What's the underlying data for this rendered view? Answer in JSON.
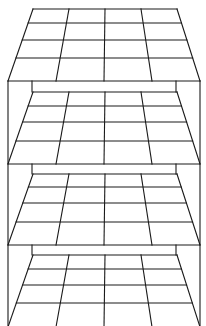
{
  "diagram": {
    "title": "",
    "colors": {
      "stroke": "#1a1a1a",
      "background": "#ffffff"
    },
    "frame": {
      "left_x": 8,
      "right_x": 200,
      "inner_left_x": 32,
      "inner_right_x": 176
    },
    "grid": {
      "columns": 4,
      "rows": 4
    },
    "planes": [
      {
        "name": "plane-1",
        "top_y": 9,
        "bottom_y": 81,
        "top_x": [
          33,
          177
        ],
        "bottom_x": [
          8,
          200
        ],
        "rows_y": [
          9,
          23,
          40,
          58,
          81
        ]
      },
      {
        "name": "plane-2",
        "top_y": 92,
        "bottom_y": 164,
        "top_x": [
          33,
          177
        ],
        "bottom_x": [
          8,
          200
        ],
        "rows_y": [
          92,
          106,
          122,
          141,
          164
        ]
      },
      {
        "name": "plane-3",
        "top_y": 174,
        "bottom_y": 245,
        "top_x": [
          33,
          177
        ],
        "bottom_x": [
          8,
          200
        ],
        "rows_y": [
          174,
          187,
          203,
          222,
          245
        ]
      },
      {
        "name": "plane-4",
        "top_y": 255,
        "bottom_y": 327,
        "top_x": [
          33,
          177
        ],
        "bottom_x": [
          8,
          200
        ],
        "rows_y": [
          255,
          269,
          285,
          303,
          327
        ]
      }
    ]
  }
}
